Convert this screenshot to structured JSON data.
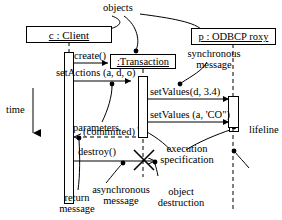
{
  "diagram": {
    "kind": "uml-sequence-diagram",
    "objects": [
      {
        "id": "client",
        "label": "c : Client",
        "x": 26,
        "y": 26,
        "w": 86,
        "h": 16
      },
      {
        "id": "transaction",
        "label": ":Transaction",
        "x": 110,
        "y": 54,
        "w": 66,
        "h": 15
      },
      {
        "id": "odbcproxy",
        "label": "p : ODBCP roxy",
        "x": 191,
        "y": 28,
        "w": 85,
        "h": 16
      }
    ],
    "messages": [
      {
        "id": "create",
        "label": "create()",
        "kind": "synchronous"
      },
      {
        "id": "setactions",
        "label": "setActions (a, d, o)",
        "kind": "synchronous"
      },
      {
        "id": "setvalues1",
        "label": "setValues(d, 3.4)",
        "kind": "synchronous"
      },
      {
        "id": "setvalues2",
        "label": "setValues (a, 'CO\")",
        "kind": "synchronous"
      },
      {
        "id": "committed",
        "label": "(committed)",
        "kind": "return"
      },
      {
        "id": "destroy",
        "label": "destroy()",
        "kind": "asynchronous"
      }
    ],
    "annotations": [
      {
        "id": "objects",
        "label": "objects"
      },
      {
        "id": "time",
        "label": "time"
      },
      {
        "id": "synchronous-message",
        "line1": "synchronous",
        "line2": "message"
      },
      {
        "id": "parameters",
        "label": "parameters"
      },
      {
        "id": "lifeline",
        "label": "lifeline"
      },
      {
        "id": "execution-spec",
        "line1": "execution",
        "line2": "specification"
      },
      {
        "id": "asynchronous-message",
        "line1": "asynchronous",
        "line2": "message"
      },
      {
        "id": "object-destruction",
        "line1": "object",
        "line2": "destruction"
      },
      {
        "id": "return-message",
        "line1": "return",
        "line2": "message"
      }
    ],
    "colors": {
      "stroke": "#000000",
      "background": "#ffffff"
    }
  }
}
